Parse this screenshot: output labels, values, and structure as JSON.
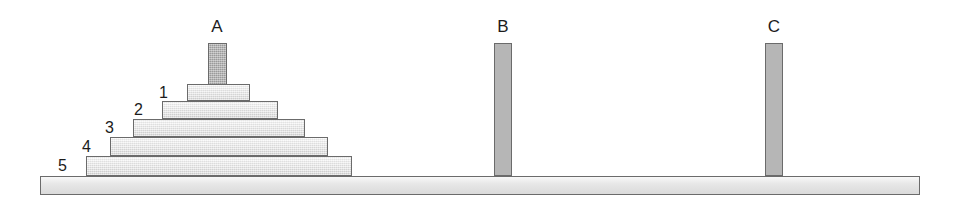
{
  "diagram": {
    "background_color": "#ffffff",
    "colors": {
      "disk_fill": "#e3e3e3",
      "peg_fill": "#adadad",
      "base_fill": "#e4e4e4",
      "outline": "#6b6b6b",
      "text": "#1c1c1c"
    }
  },
  "base": {
    "name": "base-board",
    "x": 40,
    "y": 176,
    "width": 880,
    "height": 19
  },
  "pegs": [
    {
      "label": "A",
      "name": "peg-a",
      "x": 208,
      "y": 43,
      "width": 19,
      "height": 45,
      "shade": "dark",
      "label_x": 217,
      "label_y": 18,
      "disk_count": 5
    },
    {
      "label": "B",
      "name": "peg-b",
      "x": 494,
      "y": 43,
      "width": 18,
      "height": 133,
      "shade": "light",
      "label_x": 503,
      "label_y": 18,
      "disk_count": 0
    },
    {
      "label": "C",
      "name": "peg-c",
      "x": 765,
      "y": 43,
      "width": 18,
      "height": 133,
      "shade": "light",
      "label_x": 774,
      "label_y": 18,
      "disk_count": 0
    }
  ],
  "disks": [
    {
      "label": "1",
      "name": "disk-1",
      "x": 187,
      "y": 84,
      "width": 63,
      "height": 17,
      "label_x": 168,
      "label_y": 85
    },
    {
      "label": "2",
      "name": "disk-2",
      "x": 162,
      "y": 101,
      "width": 116,
      "height": 18,
      "label_x": 143,
      "label_y": 102
    },
    {
      "label": "3",
      "name": "disk-3",
      "x": 133,
      "y": 119,
      "width": 172,
      "height": 18,
      "label_x": 114,
      "label_y": 120
    },
    {
      "label": "4",
      "name": "disk-4",
      "x": 110,
      "y": 137,
      "width": 218,
      "height": 19,
      "label_x": 91,
      "label_y": 139
    },
    {
      "label": "5",
      "name": "disk-5",
      "x": 86,
      "y": 156,
      "width": 266,
      "height": 20,
      "label_x": 67,
      "label_y": 158
    }
  ]
}
